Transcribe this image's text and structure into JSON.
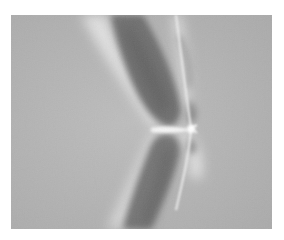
{
  "image": {
    "description": "Grayscale photoelastic-style stress field with two dark elongated lobes meeting at a bright point",
    "background_color": "#ffffff",
    "field_color": "#b4b4b4",
    "lobe_color": "#6e6e6e",
    "highlight_color": "#f4f4f4",
    "frame": {
      "x": 11,
      "y": 15,
      "width": 261,
      "height": 214
    }
  }
}
